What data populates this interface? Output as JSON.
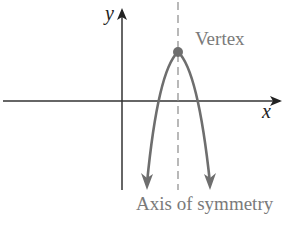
{
  "diagram": {
    "labels": {
      "y_axis": "y",
      "x_axis": "x",
      "vertex": "Vertex",
      "axis_of_symmetry": "Axis of symmetry"
    },
    "colors": {
      "axes": "#333333",
      "curve": "#6e6e6e",
      "label": "#7a7a7a",
      "dashed": "#8a8a8a"
    }
  }
}
